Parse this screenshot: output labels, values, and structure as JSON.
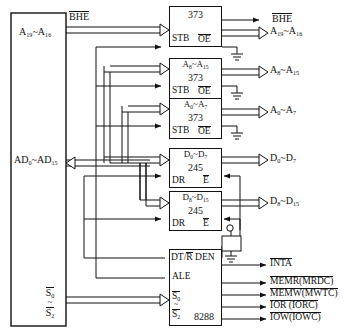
{
  "diagram": {
    "cpu": {
      "name": "cpu-block",
      "pins": [
        {
          "id": "a19_a16",
          "label": "A19~A16",
          "html": "A<sub>19</sub>~A<sub>16</sub>",
          "overline": false
        },
        {
          "id": "ad0_ad15",
          "label": "AD0~AD15",
          "html": "AD<sub>0</sub>~AD<sub>15</sub>",
          "overline": false
        },
        {
          "id": "s0",
          "label": "S0",
          "html": "S<sub>0</sub>",
          "overline": true
        },
        {
          "id": "s_sep",
          "label": "~",
          "html": "~",
          "overline": false
        },
        {
          "id": "s2",
          "label": "S2",
          "html": "S<sub>2</sub>",
          "overline": true
        }
      ],
      "bhe_label": "BHE",
      "bhe_overline": true
    },
    "latches": [
      {
        "id": "latch-373-1",
        "top": "",
        "chip": "373",
        "stb": "STB",
        "oe": "OE",
        "oe_overline": true,
        "out_label": "A19~A16",
        "out_html": "A<sub>19</sub>~A<sub>16</sub>"
      },
      {
        "id": "latch-373-2",
        "top": "A8~A15",
        "top_html": "A<sub>8</sub>~A<sub>15</sub>",
        "chip": "373",
        "stb": "STB",
        "oe": "OE",
        "oe_overline": true,
        "out_label": "A8~A15",
        "out_html": "A<sub>8</sub>~A<sub>15</sub>"
      },
      {
        "id": "latch-373-3",
        "top": "A0~A7",
        "top_html": "A<sub>0</sub>~A<sub>7</sub>",
        "chip": "373",
        "stb": "STB",
        "oe": "OE",
        "oe_overline": true,
        "out_label": "A0~A7",
        "out_html": "A<sub>0</sub>~A<sub>7</sub>"
      }
    ],
    "transceivers": [
      {
        "id": "xcvr-245-1",
        "top": "D0~D7",
        "top_html": "D<sub>0</sub>~D<sub>7</sub>",
        "chip": "245",
        "dr": "DR",
        "e": "E",
        "e_overline": true,
        "out_label": "D0~D7",
        "out_html": "D<sub>0</sub>~D<sub>7</sub>"
      },
      {
        "id": "xcvr-245-2",
        "top": "D8~D15",
        "top_html": "D<sub>8</sub>~D<sub>15</sub>",
        "chip": "245",
        "dr": "DR",
        "e": "E",
        "e_overline": true,
        "out_label": "D8~D15",
        "out_html": "D<sub>8</sub>~D<sub>15</sub>"
      }
    ],
    "controller": {
      "id": "chip-8288",
      "chip": "8288",
      "dtr": "DT/R",
      "dtr_overline_part": "R",
      "den": "DEN",
      "ale": "ALE",
      "s0": "S0",
      "s0_html": "S<sub>0</sub>",
      "sep": "~",
      "s2": "S2",
      "s2_html": "S<sub>2</sub>"
    },
    "control_outputs": [
      {
        "id": "out-inta",
        "label": "INTA",
        "overline": true
      },
      {
        "id": "out-memr",
        "label": "MEMR(MRDC)",
        "overline": true
      },
      {
        "id": "out-memw",
        "label": "MEMW(MWTC)",
        "overline": true
      },
      {
        "id": "out-ior",
        "label": "IOR (IORC)",
        "overline": true
      },
      {
        "id": "out-iow",
        "label": "IOW(IOWC)",
        "overline": true
      }
    ],
    "bus_outputs": [
      {
        "id": "bus-bhe",
        "label": "BHE",
        "overline": true
      }
    ],
    "colors": {
      "line": "#111111",
      "background": "#ffffff",
      "text": "#111111"
    }
  }
}
